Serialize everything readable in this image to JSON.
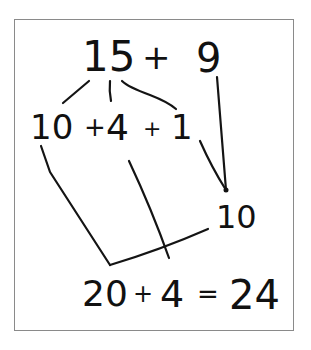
{
  "diagram": {
    "type": "handwritten-math-decomposition",
    "rows": {
      "top": {
        "left_operand": "15",
        "operator": "+",
        "right_operand": "9"
      },
      "split": {
        "part1": "10",
        "op1": "+",
        "part2": "4",
        "op2": "+",
        "part3": "1"
      },
      "combine": {
        "value": "10"
      },
      "result": {
        "term1": "20",
        "op1": "+",
        "term2": "4",
        "equals": "=",
        "answer": "24"
      }
    },
    "colors": {
      "ink": "#111111",
      "frame": "#8a8a8a",
      "background": "#ffffff"
    }
  }
}
